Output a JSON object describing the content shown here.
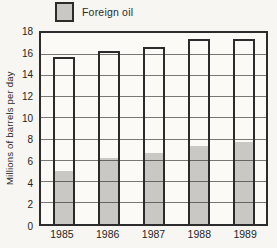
{
  "legend": {
    "label": "Foreign oil",
    "swatch_color": "#c9c8c4"
  },
  "colors": {
    "paper": "#f7f6f2",
    "line": "#2b2b2b",
    "bar_fill_foreign": "#c9c8c4",
    "bar_fill_total": "#fbfaf6"
  },
  "chart_data": {
    "type": "bar",
    "title": "",
    "ylabel": "Millions of barrels per day",
    "xlabel": "",
    "categories": [
      "1985",
      "1986",
      "1987",
      "1988",
      "1989"
    ],
    "series": [
      {
        "name": "total",
        "values": [
          15.7,
          16.3,
          16.7,
          17.4,
          17.4
        ]
      },
      {
        "name": "Foreign oil",
        "values": [
          5.1,
          6.3,
          6.8,
          7.4,
          7.8
        ]
      }
    ],
    "ylim": [
      0,
      18
    ],
    "yticks": [
      0,
      2,
      4,
      6,
      8,
      10,
      12,
      14,
      16,
      18
    ],
    "grid": true,
    "legend_position": "top-left"
  }
}
